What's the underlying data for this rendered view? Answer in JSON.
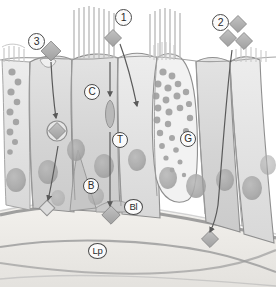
{
  "figure": {
    "type": "biological-diagram",
    "background_color": "#ffffff"
  },
  "callouts": [
    {
      "id": "callout-1",
      "label": "1",
      "x": 115,
      "y": 9,
      "meaning": "particle deposition on ciliated cell"
    },
    {
      "id": "callout-2",
      "label": "2",
      "x": 212,
      "y": 14,
      "meaning": "particle uptake at cell junction"
    },
    {
      "id": "callout-3",
      "label": "3",
      "x": 28,
      "y": 33,
      "meaning": "particle uptake by goblet / vesicle pathway"
    }
  ],
  "labels": [
    {
      "id": "label-c",
      "label": "C",
      "x": 84,
      "y": 84,
      "meaning": "ciliated cell"
    },
    {
      "id": "label-t",
      "label": "T",
      "x": 112,
      "y": 132,
      "meaning": "tight junction / transcytosis vesicle"
    },
    {
      "id": "label-g",
      "label": "G",
      "x": 180,
      "y": 131,
      "meaning": "goblet cell"
    },
    {
      "id": "label-b",
      "label": "B",
      "x": 83,
      "y": 178,
      "meaning": "basal cell"
    },
    {
      "id": "label-bl",
      "label": "Bl",
      "x": 124,
      "y": 199,
      "meaning": "basal lamina"
    },
    {
      "id": "label-lp",
      "label": "Lp",
      "x": 88,
      "y": 243,
      "meaning": "lamina propria"
    }
  ],
  "colors": {
    "outline": "#8f8f8f",
    "cell_fill": "#d2d2d2",
    "cell_fill_light": "#dedede",
    "cell_fill_pale": "#e8e8e8",
    "nucleus": "#a8a8a8",
    "granule": "#a5a5a5",
    "particle": "#b0b0b0",
    "particle_edge": "#8a8a8a",
    "basal_lamina": "#9a9a9a",
    "lamina_propria": "#eceae6",
    "cilia": "#c6c6c6",
    "arrow": "#5a5a5a",
    "label_text": "#2b2b2b",
    "label_border": "#4a4a4a"
  },
  "elements": {
    "cilia_tufts": 2,
    "microvilli_brushes": 3,
    "nuclei_count": 12,
    "goblet_granules": 26,
    "left_granule_column": 9,
    "particles": 7,
    "arrows": 5
  }
}
